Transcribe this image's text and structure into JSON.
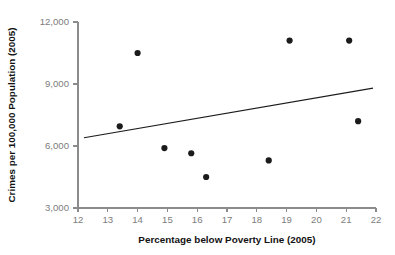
{
  "chart_data": {
    "type": "scatter",
    "title": "",
    "xlabel": "Percentage below Poverty Line (2005)",
    "ylabel": "Crimes per 100,000 Population (2005)",
    "xlim": [
      12,
      22
    ],
    "ylim": [
      3000,
      12000
    ],
    "grid": false,
    "legend": null,
    "x_ticks": [
      12,
      13,
      14,
      15,
      16,
      17,
      18,
      19,
      20,
      21,
      22
    ],
    "x_tick_labels": [
      "12",
      "13",
      "14",
      "15",
      "16",
      "17",
      "18",
      "19",
      "20",
      "21",
      "22"
    ],
    "y_ticks": [
      3000,
      6000,
      9000,
      12000
    ],
    "y_tick_labels": [
      "3,000",
      "6,000",
      "9,000",
      "12,000"
    ],
    "marker_color": "#1b1b1b",
    "line_color": "#1c1c1c",
    "axis_color": "#8b8b8b",
    "points": [
      {
        "x": 13.4,
        "y": 6950
      },
      {
        "x": 14.0,
        "y": 10500
      },
      {
        "x": 14.9,
        "y": 5900
      },
      {
        "x": 15.8,
        "y": 5650
      },
      {
        "x": 16.3,
        "y": 4500
      },
      {
        "x": 18.4,
        "y": 5300
      },
      {
        "x": 19.1,
        "y": 11100
      },
      {
        "x": 21.1,
        "y": 11100
      },
      {
        "x": 21.4,
        "y": 7200
      }
    ],
    "trend_line": {
      "x_start": 12.2,
      "y_start": 6400,
      "x_end": 21.9,
      "y_end": 8800
    }
  }
}
